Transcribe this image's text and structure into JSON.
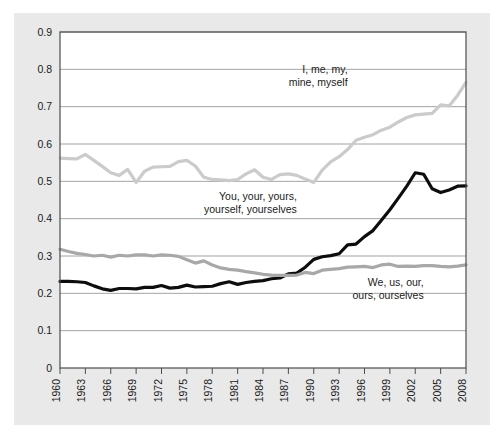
{
  "figure": {
    "background_color": "#ffffff",
    "panel_color": "#e9e9e9",
    "plot_background": "#ffffff",
    "frame_color": "#4d4d4d",
    "gridline_color": "#8c8c8c"
  },
  "chart_data": {
    "type": "line",
    "title": "",
    "subtitle": "",
    "xlabel": "",
    "ylabel": "",
    "xlim": [
      1960,
      2008
    ],
    "ylim": [
      0,
      0.9
    ],
    "grid": true,
    "grid_axis": "y",
    "legend_position": "inline-annotations",
    "y_ticks": [
      "0",
      "0.1",
      "0.2",
      "0.3",
      "0.4",
      "0.5",
      "0.6",
      "0.7",
      "0.8",
      "0.9"
    ],
    "y_tick_values": [
      0,
      0.1,
      0.2,
      0.3,
      0.4,
      0.5,
      0.6,
      0.7,
      0.8,
      0.9
    ],
    "x_ticks": [
      "1960",
      "1963",
      "1966",
      "1969",
      "1972",
      "1975",
      "1978",
      "1981",
      "1984",
      "1987",
      "1990",
      "1993",
      "1996",
      "1999",
      "2002",
      "2005",
      "2008"
    ],
    "x_tick_values": [
      1960,
      1963,
      1966,
      1969,
      1972,
      1975,
      1978,
      1981,
      1984,
      1987,
      1990,
      1993,
      1996,
      1999,
      2002,
      2005,
      2008
    ],
    "x": [
      1960,
      1961,
      1962,
      1963,
      1964,
      1965,
      1966,
      1967,
      1968,
      1969,
      1970,
      1971,
      1972,
      1973,
      1974,
      1975,
      1976,
      1977,
      1978,
      1979,
      1980,
      1981,
      1982,
      1983,
      1984,
      1985,
      1986,
      1987,
      1988,
      1989,
      1990,
      1991,
      1992,
      1993,
      1994,
      1995,
      1996,
      1997,
      1998,
      1999,
      2000,
      2001,
      2002,
      2003,
      2004,
      2005,
      2006,
      2007,
      2008
    ],
    "series": [
      {
        "name": "I, me, my, mine, myself",
        "color": "#cbcbcb",
        "annotation": "I, me, my,\nmine, myself",
        "values": [
          0.562,
          0.561,
          0.56,
          0.572,
          0.556,
          0.54,
          0.523,
          0.516,
          0.532,
          0.497,
          0.527,
          0.538,
          0.539,
          0.54,
          0.553,
          0.556,
          0.541,
          0.511,
          0.505,
          0.504,
          0.502,
          0.505,
          0.52,
          0.531,
          0.511,
          0.505,
          0.518,
          0.52,
          0.516,
          0.506,
          0.497,
          0.53,
          0.552,
          0.566,
          0.585,
          0.61,
          0.618,
          0.625,
          0.637,
          0.645,
          0.659,
          0.671,
          0.678,
          0.68,
          0.682,
          0.705,
          0.702,
          0.73,
          0.765
        ]
      },
      {
        "name": "You, your, yours, yourself, yourselves",
        "color": "#0d0d0d",
        "annotation": "You, your, yours,\nyourself, yourselves",
        "values": [
          0.232,
          0.232,
          0.231,
          0.229,
          0.22,
          0.212,
          0.208,
          0.213,
          0.213,
          0.212,
          0.216,
          0.216,
          0.221,
          0.214,
          0.216,
          0.222,
          0.217,
          0.218,
          0.219,
          0.226,
          0.231,
          0.224,
          0.229,
          0.232,
          0.234,
          0.239,
          0.241,
          0.252,
          0.254,
          0.27,
          0.291,
          0.298,
          0.301,
          0.306,
          0.33,
          0.332,
          0.352,
          0.368,
          0.396,
          0.424,
          0.455,
          0.487,
          0.523,
          0.519,
          0.48,
          0.47,
          0.477,
          0.487,
          0.488
        ]
      },
      {
        "name": "We, us, our, ours, ourselves",
        "color": "#a8a8a8",
        "annotation": "We, us, our,\nours, ourselves",
        "values": [
          0.318,
          0.312,
          0.307,
          0.304,
          0.3,
          0.302,
          0.297,
          0.302,
          0.3,
          0.303,
          0.303,
          0.3,
          0.303,
          0.302,
          0.299,
          0.29,
          0.281,
          0.287,
          0.276,
          0.268,
          0.264,
          0.262,
          0.258,
          0.255,
          0.251,
          0.249,
          0.248,
          0.248,
          0.249,
          0.256,
          0.253,
          0.262,
          0.264,
          0.266,
          0.27,
          0.271,
          0.272,
          0.269,
          0.276,
          0.278,
          0.272,
          0.273,
          0.272,
          0.274,
          0.274,
          0.272,
          0.271,
          0.273,
          0.276
        ]
      }
    ],
    "annotations": [
      {
        "text_line1": "I, me, my,",
        "text_line2": "mine, myself",
        "x": 1994,
        "y": 0.79
      },
      {
        "text_line1": "You, your, yours,",
        "text_line2": "yourself, yourselves",
        "x": 1988,
        "y": 0.45
      },
      {
        "text_line1": "We, us, our,",
        "text_line2": "ours, ourselves",
        "x": 2003,
        "y": 0.22
      }
    ]
  }
}
